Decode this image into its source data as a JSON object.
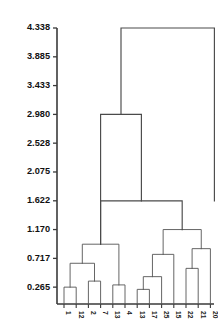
{
  "chart_data": {
    "type": "dendrogram",
    "title": "",
    "xlabel": "",
    "ylabel": "",
    "grid": false,
    "legend": "none",
    "ylim": [
      0.0,
      4.338
    ],
    "y_ticks": [
      "4.338",
      "3.885",
      "3.433",
      "2.980",
      "2.528",
      "2.075",
      "1.622",
      "1.170",
      "0.717",
      "0.265"
    ],
    "y_tick_values": [
      4.338,
      3.885,
      3.433,
      2.98,
      2.528,
      2.075,
      1.622,
      1.17,
      0.717,
      0.265
    ],
    "leaf_labels": [
      "1",
      "12",
      "2",
      "7",
      "13",
      "4",
      "13",
      "17",
      "25",
      "15",
      "22",
      "21",
      "20"
    ],
    "leaf_count": 13,
    "merges": [
      {
        "id": "m1",
        "left": "1",
        "right": "12",
        "height": 0.265
      },
      {
        "id": "m2",
        "left": "2",
        "right": "7",
        "height": 0.36
      },
      {
        "id": "m3",
        "left": "m1",
        "right": "m2",
        "height": 0.64
      },
      {
        "id": "m4",
        "left": "13",
        "right": "4",
        "height": 0.3
      },
      {
        "id": "m5",
        "left": "m3",
        "right": "m4",
        "height": 0.94
      },
      {
        "id": "m6",
        "left": "13b",
        "right": "17",
        "height": 0.23
      },
      {
        "id": "m7",
        "left": "m6",
        "right": "25",
        "height": 0.43
      },
      {
        "id": "m8",
        "left": "m7",
        "right": "15",
        "height": 0.78
      },
      {
        "id": "m9",
        "left": "22",
        "right": "21",
        "height": 0.56
      },
      {
        "id": "m10",
        "left": "m9",
        "right": "20",
        "height": 0.87
      },
      {
        "id": "m11",
        "left": "m8",
        "right": "m10",
        "height": 1.17
      },
      {
        "id": "m12",
        "left": "m5",
        "right": "m11",
        "height": 1.622
      },
      {
        "id": "m13",
        "left": "m12_left_stem",
        "right": "m12",
        "height": 2.98
      },
      {
        "id": "root",
        "left": "m13",
        "right": "right-branch",
        "height": 4.338
      }
    ],
    "axis": {
      "top_value": 4.338,
      "baseline_value": 0.0
    }
  },
  "figure": {
    "background": "#ffffff",
    "line_color": "#555555",
    "axis_color": "#3a3a3a",
    "text_color": "#111111"
  }
}
